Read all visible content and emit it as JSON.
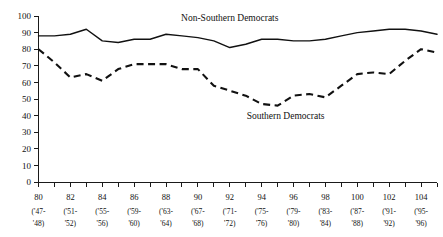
{
  "chart_data": {
    "type": "line",
    "title": "",
    "xlabel": "",
    "ylabel": "",
    "ylim": [
      0,
      100
    ],
    "ytick_values": [
      0,
      10,
      20,
      30,
      40,
      50,
      60,
      70,
      80,
      90,
      100
    ],
    "ytick_labels": [
      "0",
      "10",
      "20",
      "30",
      "40",
      "50",
      "60",
      "70",
      "80",
      "90",
      "100"
    ],
    "grid": false,
    "legend_position": "inline-annotation",
    "x": [
      80,
      81,
      82,
      83,
      84,
      85,
      86,
      87,
      88,
      89,
      90,
      91,
      92,
      93,
      94,
      95,
      96,
      97,
      98,
      99,
      100,
      101,
      102,
      103,
      104,
      105
    ],
    "xtick_values": [
      80,
      82,
      84,
      86,
      88,
      90,
      92,
      94,
      96,
      98,
      100,
      102,
      104
    ],
    "xtick_labels": [
      {
        "num": "80",
        "year_top": "('47-",
        "year_bottom": "'48)"
      },
      {
        "num": "82",
        "year_top": "('51-",
        "year_bottom": "'52)"
      },
      {
        "num": "84",
        "year_top": "('55-",
        "year_bottom": "'56)"
      },
      {
        "num": "86",
        "year_top": "('59-",
        "year_bottom": "'60)"
      },
      {
        "num": "88",
        "year_top": "('63-",
        "year_bottom": "'64)"
      },
      {
        "num": "90",
        "year_top": "('67-",
        "year_bottom": "'68)"
      },
      {
        "num": "92",
        "year_top": "('71-",
        "year_bottom": "'72)"
      },
      {
        "num": "94",
        "year_top": "('75-",
        "year_bottom": "'76)"
      },
      {
        "num": "96",
        "year_top": "('79-",
        "year_bottom": "'80)"
      },
      {
        "num": "98",
        "year_top": "('83-",
        "year_bottom": "'84)"
      },
      {
        "num": "100",
        "year_top": "('87-",
        "year_bottom": "'88)"
      },
      {
        "num": "102",
        "year_top": "('91-",
        "year_bottom": "'92)"
      },
      {
        "num": "104",
        "year_top": "('95-",
        "year_bottom": "'96)"
      }
    ],
    "series": [
      {
        "name": "Non-Southern Democrats",
        "style": "solid",
        "color": "#111111",
        "label_x": 92,
        "label_y": 97,
        "values": [
          88,
          88,
          89,
          92,
          85,
          84,
          86,
          86,
          89,
          88,
          87,
          85,
          81,
          83,
          86,
          86,
          85,
          85,
          86,
          88,
          90,
          91,
          92,
          92,
          91,
          89
        ]
      },
      {
        "name": "Southern Democrats",
        "style": "dashed",
        "color": "#111111",
        "label_x": 95.5,
        "label_y": 38,
        "values": [
          80,
          72,
          63,
          65,
          61,
          68,
          71,
          71,
          71,
          68,
          68,
          58,
          55,
          52,
          47,
          46,
          52,
          53,
          51,
          58,
          65,
          66,
          65,
          73,
          80,
          78
        ]
      }
    ]
  }
}
